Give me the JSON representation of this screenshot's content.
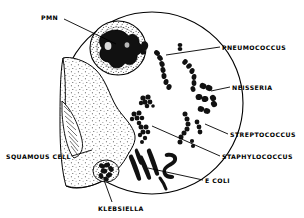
{
  "figure": {
    "view_shape": "circle",
    "line_color": "#000000",
    "background_color": "#ffffff",
    "stipple_color": "#2b2b2b"
  },
  "labels": [
    {
      "id": "pmn",
      "text": "PMN",
      "x": 41,
      "y": 14,
      "align": "left",
      "leader_from": [
        64,
        19
      ],
      "leader_to": [
        116,
        44
      ]
    },
    {
      "id": "pneumococcus",
      "text": "PNEUMOCOCCUS",
      "x": 222,
      "y": 44,
      "align": "left",
      "leader_from": [
        220,
        47
      ],
      "leader_to": [
        166,
        55
      ]
    },
    {
      "id": "neisseria",
      "text": "NEISSERIA",
      "x": 232,
      "y": 84,
      "align": "left",
      "leader_from": [
        230,
        87
      ],
      "leader_to": [
        211,
        91
      ]
    },
    {
      "id": "streptococcus",
      "text": "STREPTOCOCCUS",
      "x": 230,
      "y": 131,
      "align": "left",
      "leader_from": [
        228,
        134
      ],
      "leader_to": [
        205,
        124
      ]
    },
    {
      "id": "staphylococcus",
      "text": "STAPHYLOCOCCUS",
      "x": 222,
      "y": 153,
      "align": "left",
      "leader_from": [
        220,
        156
      ],
      "leader_to": [
        152,
        126
      ]
    },
    {
      "id": "ecoli",
      "text": "E  COLI",
      "x": 205,
      "y": 177,
      "align": "left",
      "leader_from": [
        203,
        180
      ],
      "leader_to": [
        148,
        168
      ]
    },
    {
      "id": "squamous_cell",
      "text": "SQUAMOUS CELL",
      "x": 6,
      "y": 153,
      "align": "left",
      "leader_from": [
        72,
        156
      ],
      "leader_to": [
        92,
        150
      ]
    },
    {
      "id": "klebsiella",
      "text": "KLEBSIELLA",
      "x": 98,
      "y": 205,
      "align": "left",
      "leader_from": [
        112,
        202
      ],
      "leader_to": [
        104,
        180
      ]
    }
  ],
  "elements": {
    "pmn_cell": {
      "name": "polymorphonuclear-leukocyte",
      "nucleus_lobes": 4
    },
    "squamous_cell": {
      "name": "squamous-epithelial-cell",
      "texture": "stippled"
    },
    "pneumococcus": {
      "name": "pneumococcus-chains",
      "morphology": "lancet-shaped diplococci in chains",
      "count": 4
    },
    "neisseria": {
      "name": "neisseria-diplococci",
      "morphology": "kidney-bean paired cocci",
      "count": 6
    },
    "streptococcus": {
      "name": "streptococcus-chains",
      "morphology": "cocci in chains",
      "count": 3
    },
    "staphylococcus": {
      "name": "staphylococcus-clusters",
      "morphology": "grape-like clusters",
      "count": 3
    },
    "ecoli": {
      "name": "escherichia-coli-rods",
      "morphology": "gram-negative bacilli",
      "count": 6
    },
    "klebsiella": {
      "name": "klebsiella-encapsulated-rods",
      "morphology": "encapsulated plump bacilli",
      "count": 1
    }
  }
}
